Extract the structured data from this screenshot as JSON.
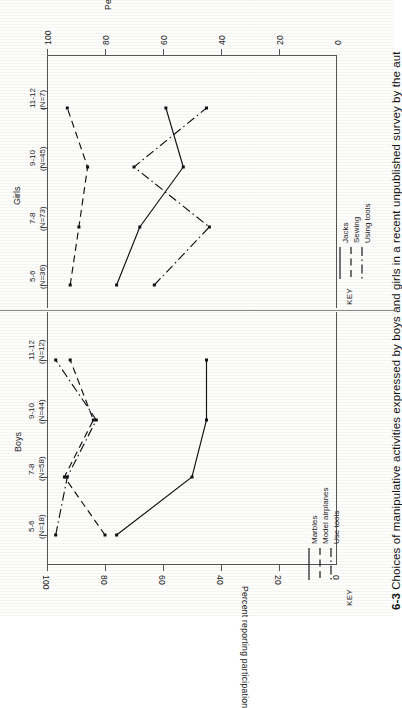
{
  "figure": {
    "number": "6-3",
    "caption": "Choices of manipulative activities expressed by boys and girls in a recent unpublished survey by the aut",
    "axis_title": "Percent reporting participation",
    "key_word": "KEY"
  },
  "chart_data": [
    {
      "type": "line",
      "title": "Girls",
      "orientation": "horizontal-rotated",
      "xlabel": "",
      "ylabel": "Percent reporting participation",
      "categories": [
        "5-6\n(N=36)",
        "7-8\n(N=73)",
        "9-10\n(N=45)",
        "11-12\n(N=7)"
      ],
      "category_ages": [
        "5-6",
        "7-8",
        "9-10",
        "11-12"
      ],
      "category_counts": [
        "(N=36)",
        "(N=73)",
        "(N=45)",
        "(N=7)"
      ],
      "ticks": [
        100,
        80,
        60,
        40,
        20,
        0
      ],
      "ylim": [
        0,
        100
      ],
      "grid": false,
      "legend_position": "bottom-key",
      "series": [
        {
          "name": "Jacks",
          "style": "solid",
          "values": [
            76,
            68,
            53,
            59
          ]
        },
        {
          "name": "Sewing",
          "style": "dashed",
          "values": [
            92,
            89,
            86,
            93
          ]
        },
        {
          "name": "Using tools",
          "style": "dashdot",
          "values": [
            63,
            44,
            70,
            45
          ]
        }
      ]
    },
    {
      "type": "line",
      "title": "Boys",
      "orientation": "horizontal-rotated",
      "xlabel": "",
      "ylabel": "Percent reporting participation",
      "categories": [
        "5-6\n(N=18)",
        "7-8\n(N=58)",
        "9-10\n(N=44)",
        "11-12\n(N=12)"
      ],
      "category_ages": [
        "5-6",
        "7-8",
        "9-10",
        "11-12"
      ],
      "category_counts": [
        "(N=18)",
        "(N=58)",
        "(N=44)",
        "(N=12)"
      ],
      "ticks": [
        100,
        80,
        60,
        40,
        20,
        0
      ],
      "ylim": [
        0,
        100
      ],
      "grid": false,
      "legend_position": "bottom-key",
      "series": [
        {
          "name": "Marbles",
          "style": "solid",
          "values": [
            76,
            50,
            45,
            45
          ]
        },
        {
          "name": "Model airplanes",
          "style": "dashed",
          "values": [
            80,
            94,
            84,
            92
          ]
        },
        {
          "name": "Use tools",
          "style": "dashdot",
          "values": [
            97,
            93,
            83,
            97
          ]
        }
      ]
    }
  ],
  "girls": {
    "title": "Girls",
    "axis_title": "Percent reporting participation",
    "key_word": "KEY",
    "ticklabels": [
      "100",
      "80",
      "60",
      "40",
      "20",
      "0"
    ],
    "cats": [
      {
        "age": "11-12",
        "n": "(N=7)"
      },
      {
        "age": "9-10",
        "n": "(N=45)"
      },
      {
        "age": "7-8",
        "n": "(N=73)"
      },
      {
        "age": "5-6",
        "n": "(N=36)"
      }
    ],
    "legend": [
      {
        "label": "Jacks",
        "style": "solid"
      },
      {
        "label": "Sewing",
        "style": "dashed"
      },
      {
        "label": "Using tools",
        "style": "dashdot"
      }
    ]
  },
  "boys": {
    "title": "Boys",
    "axis_title": "Percent reporting participation",
    "key_word": "KEY",
    "ticklabels": [
      "100",
      "80",
      "60",
      "40",
      "20",
      "0"
    ],
    "cats": [
      {
        "age": "11-12",
        "n": "(N=12)"
      },
      {
        "age": "9-10",
        "n": "(N=44)"
      },
      {
        "age": "7-8",
        "n": "(N=58)"
      },
      {
        "age": "5-6",
        "n": "(N=18)"
      }
    ],
    "legend": [
      {
        "label": "Marbles",
        "style": "solid"
      },
      {
        "label": "Model airplanes",
        "style": "dashed"
      },
      {
        "label": "Use tools",
        "style": "dashdot"
      }
    ]
  }
}
